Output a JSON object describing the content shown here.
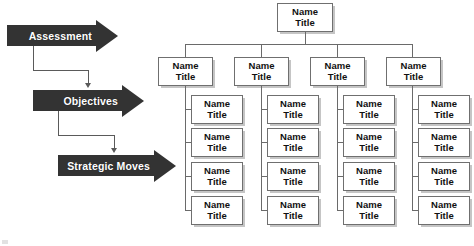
{
  "diagram": {
    "background_color": "#ffffff"
  },
  "flow": {
    "accent_color": "#333333",
    "connector_color": "#5a5a5a",
    "steps": [
      {
        "label": "Assessment",
        "name": "assessment"
      },
      {
        "label": "Objectives",
        "name": "objectives"
      },
      {
        "label": "Strategic Moves",
        "name": "strategic-moves"
      }
    ]
  },
  "org_chart": {
    "node_border_color": "#6f6f6f",
    "node_text_color": "#111111",
    "connector_color": "#6a6a6a",
    "root": {
      "line1": "Name",
      "line2": "Title"
    },
    "branches": [
      {
        "head": {
          "line1": "Name",
          "line2": "Title"
        },
        "leaves": [
          {
            "line1": "Name",
            "line2": "Title"
          },
          {
            "line1": "Name",
            "line2": "Title"
          },
          {
            "line1": "Name",
            "line2": "Title"
          },
          {
            "line1": "Name",
            "line2": "Title"
          }
        ]
      },
      {
        "head": {
          "line1": "Name",
          "line2": "Title"
        },
        "leaves": [
          {
            "line1": "Name",
            "line2": "Title"
          },
          {
            "line1": "Name",
            "line2": "Title"
          },
          {
            "line1": "Name",
            "line2": "Title"
          },
          {
            "line1": "Name",
            "line2": "Title"
          }
        ]
      },
      {
        "head": {
          "line1": "Name",
          "line2": "Title"
        },
        "leaves": [
          {
            "line1": "Name",
            "line2": "Title"
          },
          {
            "line1": "Name",
            "line2": "Title"
          },
          {
            "line1": "Name",
            "line2": "Title"
          },
          {
            "line1": "Name",
            "line2": "Title"
          }
        ]
      },
      {
        "head": {
          "line1": "Name",
          "line2": "Title"
        },
        "leaves": [
          {
            "line1": "Name",
            "line2": "Title"
          },
          {
            "line1": "Name",
            "line2": "Title"
          },
          {
            "line1": "Name",
            "line2": "Title"
          },
          {
            "line1": "Name",
            "line2": "Title"
          }
        ]
      }
    ]
  }
}
